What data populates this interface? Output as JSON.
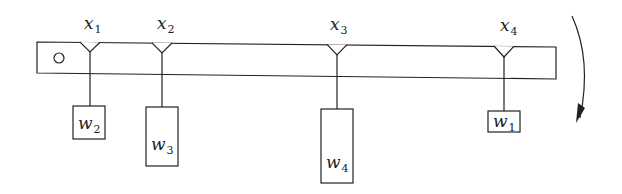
{
  "diagram": {
    "type": "lever-beam-with-hanging-weights",
    "beam": {
      "pivot_icon": "circle-pivot-icon"
    },
    "positions": [
      {
        "var": "x",
        "sub": "1"
      },
      {
        "var": "x",
        "sub": "2"
      },
      {
        "var": "x",
        "sub": "3"
      },
      {
        "var": "x",
        "sub": "4"
      }
    ],
    "weights": [
      {
        "var": "w",
        "sub": "2",
        "at": "x1"
      },
      {
        "var": "w",
        "sub": "3",
        "at": "x2"
      },
      {
        "var": "w",
        "sub": "4",
        "at": "x3"
      },
      {
        "var": "w",
        "sub": "1",
        "at": "x4"
      }
    ],
    "rotation_arrow": "clockwise-arrow-icon",
    "colors": {
      "line": "#222222",
      "background": "#ffffff"
    }
  }
}
